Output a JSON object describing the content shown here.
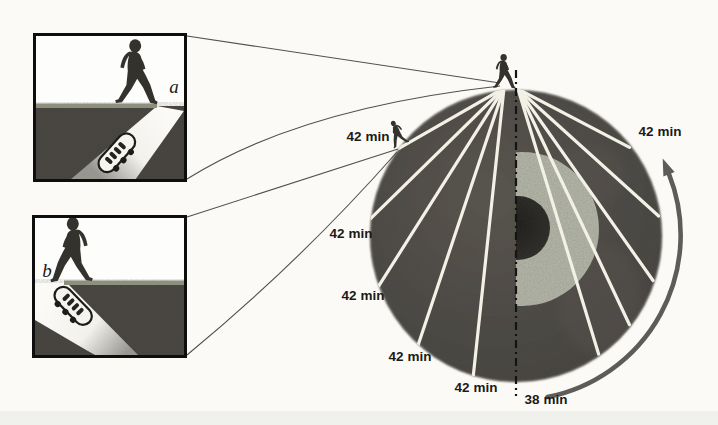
{
  "figure_type": "earth-tunnel-travel-time-diagram",
  "insets": {
    "a": {
      "label": "a"
    },
    "b": {
      "label": "b"
    }
  },
  "earth": {
    "tunnel_labels": [
      "42 min",
      "42 min",
      "42 min",
      "42 min",
      "42 min"
    ],
    "around_surface_label": "42 min",
    "center_tunnel_label": "38 min"
  },
  "colors": {
    "background": "#fbfaf6",
    "sky": "#fdfdfb",
    "mantle": "#4c4843",
    "mantle_light": "#5e5952",
    "outer_core": "#b8bbac",
    "inner_core": "#23211e",
    "tunnel_line": "#f3f0e6",
    "axis_line": "#141412",
    "arrow": "#5d5c58",
    "label_text": "#1b1a18",
    "ground": "#474440",
    "surface_strip": "#8d907c",
    "silhouette": "#34322c",
    "connector": "#53504d",
    "pod_body": "#f5f4ee",
    "pod_dark": "#1c1c1a"
  }
}
